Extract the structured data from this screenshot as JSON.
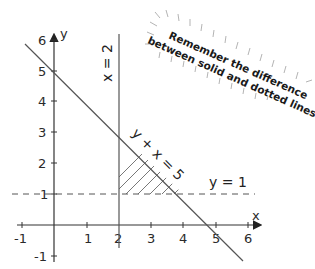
{
  "diagram": {
    "axes": {
      "x_label": "x",
      "y_label": "y",
      "x_ticks": [
        "-1",
        "1",
        "2",
        "3",
        "4",
        "5",
        "6"
      ],
      "y_ticks": [
        "6",
        "5",
        "4",
        "3",
        "2",
        "1",
        "-1"
      ]
    },
    "lines": {
      "vertical": "x = 2",
      "diagonal": "y + x = 5",
      "horizontal": "y = 1"
    },
    "note": {
      "line1": "Remember the difference",
      "line2": "between solid and dotted lines."
    },
    "colors": {
      "line": "#555555",
      "text": "#222222",
      "hatch": "#444444"
    }
  }
}
